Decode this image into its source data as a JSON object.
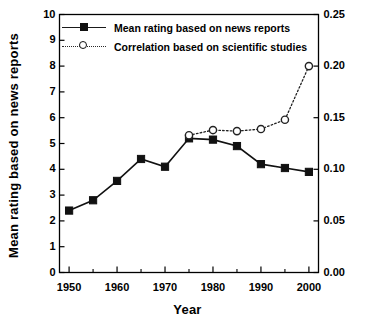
{
  "chart_data": {
    "type": "line",
    "title": "",
    "xlabel": "Year",
    "ylabel": "Mean rating based on news reports",
    "ylabel_right": "",
    "xlim": [
      1948,
      2002
    ],
    "ylim": [
      0,
      10
    ],
    "ylim_right": [
      0.0,
      0.25
    ],
    "grid": false,
    "legend_position": "upper-left-inside",
    "x_ticks": [
      1950,
      1960,
      1970,
      1980,
      1990,
      2000
    ],
    "x_minor_ticks": [
      1955,
      1965,
      1975,
      1985,
      1995
    ],
    "x_tick_labels": [
      "1950",
      "1960",
      "1970",
      "1980",
      "1990",
      "2000"
    ],
    "y_ticks_left": [
      0,
      1,
      2,
      3,
      4,
      5,
      6,
      7,
      8,
      9,
      10
    ],
    "y_tick_labels_left": [
      "0",
      "1",
      "2",
      "3",
      "4",
      "5",
      "6",
      "7",
      "8",
      "9",
      "10"
    ],
    "y_ticks_right": [
      0.0,
      0.05,
      0.1,
      0.15,
      0.2,
      0.25
    ],
    "y_tick_labels_right": [
      "0.00",
      "0.05",
      "0.10",
      "0.15",
      "0.20",
      "0.25"
    ],
    "series": [
      {
        "name": "Mean rating based on news reports",
        "axis": "left",
        "marker": "filled-square",
        "linestyle": "solid",
        "color": "#111111",
        "x": [
          1950,
          1955,
          1960,
          1965,
          1970,
          1975,
          1980,
          1985,
          1990,
          1995,
          2000
        ],
        "values": [
          2.4,
          2.8,
          3.55,
          4.4,
          4.1,
          5.2,
          5.15,
          4.9,
          4.2,
          4.05,
          3.9
        ]
      },
      {
        "name": "Correlation based on scientific studies",
        "axis": "right",
        "marker": "open-circle",
        "linestyle": "dotted",
        "color": "#222222",
        "x": [
          1975,
          1980,
          1985,
          1990,
          1995,
          2000
        ],
        "values": [
          0.133,
          0.138,
          0.137,
          0.139,
          0.148,
          0.2
        ]
      }
    ]
  },
  "legend": {
    "entries": [
      {
        "label": "Mean rating based on news reports"
      },
      {
        "label": "Correlation based on scientific studies"
      }
    ]
  }
}
